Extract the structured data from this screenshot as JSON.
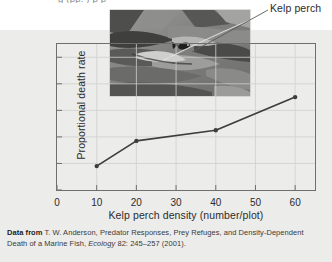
{
  "figure": {
    "top_partial_text": "g (pp. ) p p",
    "photo_caption_label": "Kelp perch",
    "photo_alt_name": "kelp-perch-underwater-photo"
  },
  "chart_data": {
    "type": "line",
    "title": "",
    "xlabel": "Kelp perch density (number/plot)",
    "ylabel": "Proportional death rate",
    "x": [
      10,
      20,
      40,
      60
    ],
    "values": [
      0.18,
      0.37,
      0.45,
      0.7
    ],
    "series": [
      {
        "name": "Proportional death rate",
        "x": [
          10,
          20,
          40,
          60
        ],
        "values": [
          0.18,
          0.37,
          0.45,
          0.7
        ]
      }
    ],
    "xticks": [
      "0",
      "10",
      "20",
      "30",
      "40",
      "50",
      "60"
    ],
    "xtick_values": [
      0,
      10,
      20,
      30,
      40,
      50,
      60
    ],
    "yticks": [
      "0",
      "0.2",
      "0.4",
      "0.6",
      "0.8",
      "1.0"
    ],
    "ytick_values": [
      0,
      0.2,
      0.4,
      0.6,
      0.8,
      1.0
    ],
    "xlim": [
      0,
      65
    ],
    "ylim": [
      0,
      1.1
    ],
    "grid": true,
    "legend": "none",
    "marker": "filled-circle",
    "line_color": "#3d3d3d",
    "grid_color": "#cfcfcd",
    "axis_color": "#6f6f6f"
  },
  "caption": {
    "lead": "Data from",
    "text_line1": " T. W. Anderson, Predator Responses, Prey Refuges, and Density-Dependent",
    "text_line2_a": "Death  of a Marine Fish, ",
    "journal": "Ecology",
    "text_line2_b": " 82: 245–257 (2001)."
  },
  "colors": {
    "panel_background": "#ececeb",
    "page_background": "#ffffff",
    "text": "#2b2b2b",
    "accent": "#3d3d3d"
  }
}
